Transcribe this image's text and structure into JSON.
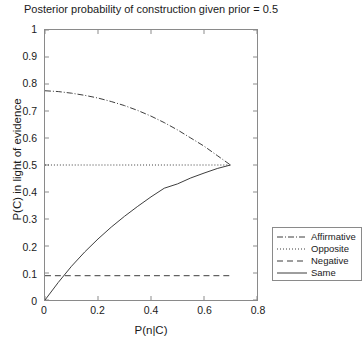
{
  "chart_data": {
    "type": "line",
    "title": "Posterior probability of construction given prior = 0.5",
    "xlabel": "P(n|C)",
    "ylabel": "P(C) in light of evidence",
    "xlim": [
      0,
      0.8
    ],
    "ylim": [
      0,
      1
    ],
    "xticks": [
      "0",
      "0.2",
      "0.4",
      "0.6",
      "0.8"
    ],
    "xtick_values": [
      0,
      0.2,
      0.4,
      0.6,
      0.8
    ],
    "yticks": [
      "0",
      "0.1",
      "0.2",
      "0.3",
      "0.4",
      "0.5",
      "0.6",
      "0.7",
      "0.8",
      "0.9",
      "1"
    ],
    "ytick_values": [
      0,
      0.1,
      0.2,
      0.3,
      0.4,
      0.5,
      0.6,
      0.7,
      0.8,
      0.9,
      1
    ],
    "grid": false,
    "legend_position": "lower-right-outside",
    "series": [
      {
        "name": "Affirmative",
        "style": "dash-dot",
        "color": "#3c3c3c",
        "x": [
          0.0,
          0.05,
          0.1,
          0.15,
          0.2,
          0.25,
          0.3,
          0.35,
          0.4,
          0.45,
          0.5,
          0.55,
          0.6,
          0.65,
          0.7
        ],
        "y": [
          0.775,
          0.772,
          0.766,
          0.758,
          0.748,
          0.735,
          0.72,
          0.702,
          0.681,
          0.657,
          0.63,
          0.6,
          0.57,
          0.535,
          0.5
        ]
      },
      {
        "name": "Opposite",
        "style": "dotted",
        "color": "#3c3c3c",
        "x": [
          0.0,
          0.7
        ],
        "y": [
          0.5,
          0.5
        ]
      },
      {
        "name": "Negative",
        "style": "dashed",
        "color": "#3c3c3c",
        "x": [
          0.0,
          0.7
        ],
        "y": [
          0.09,
          0.09
        ]
      },
      {
        "name": "Same",
        "style": "solid",
        "color": "#3c3c3c",
        "x": [
          0.0,
          0.05,
          0.1,
          0.15,
          0.2,
          0.25,
          0.3,
          0.35,
          0.4,
          0.45,
          0.5,
          0.55,
          0.6,
          0.65,
          0.7
        ],
        "y": [
          0.0,
          0.065,
          0.125,
          0.178,
          0.226,
          0.27,
          0.31,
          0.347,
          0.382,
          0.414,
          0.43,
          0.452,
          0.47,
          0.487,
          0.5
        ]
      }
    ]
  },
  "legend": {
    "items": [
      {
        "label": "Affirmative"
      },
      {
        "label": "Opposite"
      },
      {
        "label": "Negative"
      },
      {
        "label": "Same"
      }
    ]
  }
}
